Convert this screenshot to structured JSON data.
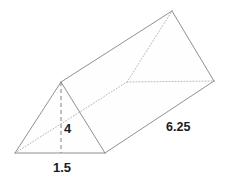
{
  "figure": {
    "kind": "triangular-prism",
    "colors": {
      "background": "#ffffff",
      "visible_edge": "#8e9196",
      "hidden_edge": "#b6babe",
      "altitude_line": "#7e8287",
      "label_text": "#1c1c1c"
    },
    "labels": {
      "height": "4",
      "base": "1.5",
      "length": "6.25"
    },
    "label_positions": {
      "height": {
        "x": 64,
        "y": 133
      },
      "base": {
        "x": 62,
        "y": 172
      },
      "length": {
        "x": 166,
        "y": 131
      }
    },
    "vertices": {
      "front_bottom_left": {
        "x": 15,
        "y": 153
      },
      "front_bottom_right": {
        "x": 105,
        "y": 153
      },
      "front_apex": {
        "x": 61,
        "y": 82
      },
      "back_bottom_left": {
        "x": 127,
        "y": 82
      },
      "back_bottom_right": {
        "x": 214,
        "y": 81
      },
      "back_apex": {
        "x": 172,
        "y": 11
      }
    },
    "edges": {
      "visible": [
        "front_bottom_left -> front_bottom_right",
        "front_bottom_left -> front_apex",
        "front_apex -> front_bottom_right",
        "front_apex -> back_apex",
        "back_apex -> back_bottom_right",
        "front_bottom_right -> back_bottom_right",
        "front_bottom_left(base) -> front_bottom_right(base)"
      ],
      "hidden": [
        "front_bottom_left -> back_bottom_left",
        "back_bottom_left -> back_bottom_right",
        "back_bottom_left -> back_apex"
      ],
      "dashed_altitude": "front_apex -> base midpoint (61,153)"
    }
  }
}
